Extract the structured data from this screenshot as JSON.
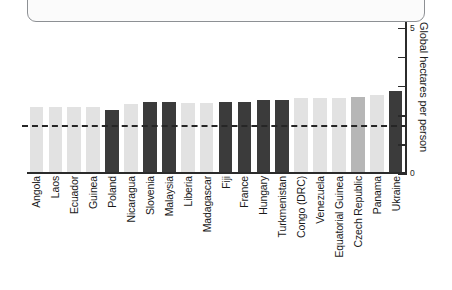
{
  "chart_data": {
    "type": "bar",
    "title": "",
    "subtitle": "",
    "xlabel": "",
    "ylabel": "Global hectares per person",
    "ylim": [
      0,
      5.2
    ],
    "yticks": [
      0,
      1,
      2,
      3,
      4,
      5
    ],
    "ytick_labels": [
      "0",
      "",
      "",
      "",
      "",
      "5"
    ],
    "grid": false,
    "legend": "none",
    "orientation": "vertical",
    "reference_line": {
      "value": 1.6,
      "style": "dashed",
      "color": "#262626"
    },
    "categories": [
      "Angola",
      "Laos",
      "Ecuador",
      "Guinea",
      "Poland",
      "Nicaragua",
      "Slovenia",
      "Malaysia",
      "Liberia",
      "Madagascar",
      "Fiji",
      "France",
      "Hungary",
      "Turkmenistan",
      "Congo (DRC)",
      "Venezuela",
      "Equatorial Guinea",
      "Czech Republic",
      "Panama",
      "Ukraine"
    ],
    "values": [
      2.26,
      2.26,
      2.26,
      2.26,
      2.16,
      2.36,
      2.43,
      2.43,
      2.4,
      2.4,
      2.46,
      2.46,
      2.53,
      2.53,
      2.57,
      2.57,
      2.6,
      2.63,
      2.67,
      2.81
    ],
    "bar_colors": [
      "light",
      "light",
      "light",
      "light",
      "dark",
      "light",
      "dark",
      "dark",
      "light",
      "light",
      "dark",
      "dark",
      "dark",
      "dark",
      "light",
      "light",
      "light",
      "mid",
      "light",
      "dark"
    ],
    "palette": {
      "light": "#e2e2e2",
      "mid": "#b6b6b6",
      "dark": "#3b3b3b",
      "axis": "#2b2b2b",
      "text": "#1a1a1a"
    }
  },
  "axis": {
    "y_title": "Global hectares per person",
    "tick_top_label": "5",
    "tick_bottom_label": "0"
  },
  "top_panel": {
    "content": ""
  }
}
